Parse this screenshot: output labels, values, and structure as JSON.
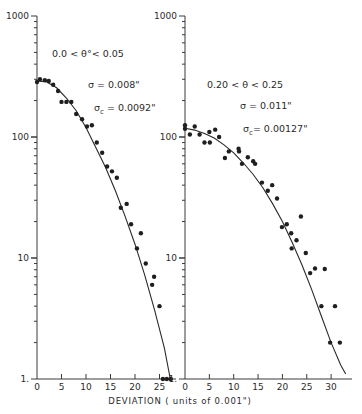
{
  "chart_data": [
    {
      "type": "scatter",
      "title": "",
      "annotation_range": "0.0 < θ°< 0.05",
      "annotation_sigma": "σ  = 0.008\"",
      "annotation_sigma_c_symbol": "σ",
      "annotation_sigma_c_sub": "c",
      "annotation_sigma_c_value": " = 0.0092\"",
      "xlabel": "DEVIATION  ( units of 0.001\")",
      "ylabel": "",
      "yscale": "log",
      "ylim": [
        1,
        1000
      ],
      "xlim": [
        0,
        28
      ],
      "x_ticks": [
        0,
        5,
        10,
        15,
        20,
        25
      ],
      "x_tick_labels": [
        "0",
        "5",
        "10",
        "15",
        "20",
        "25"
      ],
      "y_tick_labels": [
        "1.",
        "10",
        "100",
        "1000"
      ],
      "grid": false,
      "points": [
        [
          0,
          285
        ],
        [
          0.6,
          300
        ],
        [
          1.6,
          295
        ],
        [
          2.4,
          290
        ],
        [
          3.3,
          270
        ],
        [
          4.3,
          240
        ],
        [
          5,
          195
        ],
        [
          6,
          195
        ],
        [
          7,
          195
        ],
        [
          8,
          155
        ],
        [
          9.2,
          140
        ],
        [
          10.2,
          122
        ],
        [
          11.2,
          125
        ],
        [
          12.2,
          90
        ],
        [
          13.3,
          74
        ],
        [
          14.3,
          57
        ],
        [
          15.3,
          52
        ],
        [
          16.3,
          46
        ],
        [
          17.1,
          26
        ],
        [
          18.3,
          28
        ],
        [
          19.2,
          19
        ],
        [
          20.4,
          12
        ],
        [
          21.2,
          16
        ],
        [
          22.2,
          9
        ],
        [
          23.5,
          6
        ],
        [
          23.9,
          7
        ],
        [
          25,
          4
        ],
        [
          25.7,
          1
        ],
        [
          26.5,
          1
        ],
        [
          27.3,
          1
        ]
      ],
      "fit_curve": [
        [
          0,
          290
        ],
        [
          2,
          285
        ],
        [
          4,
          255
        ],
        [
          6,
          210
        ],
        [
          8,
          165
        ],
        [
          10,
          120
        ],
        [
          12,
          82
        ],
        [
          14,
          56
        ],
        [
          16,
          36
        ],
        [
          18,
          22
        ],
        [
          20,
          13
        ],
        [
          22,
          7.2
        ],
        [
          24,
          3.7
        ],
        [
          26,
          1.8
        ],
        [
          27.2,
          1
        ]
      ]
    },
    {
      "type": "scatter",
      "title": "",
      "annotation_range": "0.20 < θ < 0.25",
      "annotation_sigma": "σ  = 0.011\"",
      "annotation_sigma_c_symbol": "σ",
      "annotation_sigma_c_sub": "c",
      "annotation_sigma_c_value": "= 0.00127\"",
      "xlabel": "DEVIATION  ( units of 0.001\")",
      "ylabel": "",
      "yscale": "log",
      "ylim": [
        1,
        1000
      ],
      "xlim": [
        0,
        34
      ],
      "x_ticks": [
        0,
        5,
        10,
        15,
        20,
        25,
        30
      ],
      "x_tick_labels": [
        "0",
        "5",
        "10",
        "15",
        "20",
        "25",
        "30"
      ],
      "y_tick_labels": [
        "1.",
        "10",
        "100",
        "1000"
      ],
      "grid": false,
      "points": [
        [
          0,
          125
        ],
        [
          0,
          117
        ],
        [
          1,
          105
        ],
        [
          2,
          122
        ],
        [
          3,
          105
        ],
        [
          4,
          90
        ],
        [
          5,
          110
        ],
        [
          5.1,
          90
        ],
        [
          6.2,
          115
        ],
        [
          7,
          100
        ],
        [
          8.2,
          67
        ],
        [
          9,
          76
        ],
        [
          11,
          80
        ],
        [
          11.1,
          76
        ],
        [
          11.7,
          60
        ],
        [
          12.9,
          68
        ],
        [
          14,
          63
        ],
        [
          14.4,
          60
        ],
        [
          15.8,
          42
        ],
        [
          17,
          36
        ],
        [
          17.9,
          40
        ],
        [
          18.9,
          31
        ],
        [
          19.9,
          18
        ],
        [
          20.9,
          19
        ],
        [
          21.8,
          16
        ],
        [
          21.9,
          12
        ],
        [
          22.9,
          14
        ],
        [
          23.8,
          22
        ],
        [
          24.8,
          11
        ],
        [
          25.7,
          7.5
        ],
        [
          26.7,
          8.2
        ],
        [
          28,
          4
        ],
        [
          28.7,
          8.1
        ],
        [
          29.8,
          2
        ],
        [
          30.8,
          4
        ],
        [
          31.8,
          2
        ]
      ],
      "fit_curve": [
        [
          0,
          118
        ],
        [
          2,
          114
        ],
        [
          4,
          107
        ],
        [
          6,
          98
        ],
        [
          8,
          86
        ],
        [
          10,
          74
        ],
        [
          12,
          61
        ],
        [
          14,
          49
        ],
        [
          16,
          38
        ],
        [
          18,
          28
        ],
        [
          20,
          20
        ],
        [
          22,
          13.5
        ],
        [
          24,
          8.8
        ],
        [
          26,
          5.5
        ],
        [
          28,
          3.3
        ],
        [
          30,
          2
        ],
        [
          32,
          1.3
        ],
        [
          33,
          1.1
        ]
      ]
    }
  ],
  "figure": {
    "xlabel": "DEVIATION  ( units of 0.001\")",
    "y_axis_labels": {
      "top": "1000",
      "upper": "100",
      "lower": "10",
      "bottom": "1."
    }
  }
}
